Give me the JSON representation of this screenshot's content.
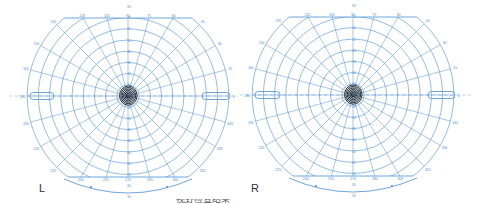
{
  "chart_data": [
    {
      "type": "polar-perimetry",
      "title": "Visual field (left eye)",
      "eye": "L",
      "center": [
        128,
        96
      ],
      "px_per_10deg": 11.2,
      "rings_deg": [
        10,
        20,
        30,
        40,
        50,
        60,
        70,
        80,
        90
      ],
      "meridians_deg": [
        0,
        15,
        30,
        45,
        60,
        75,
        90,
        105,
        120,
        135,
        150,
        165,
        180,
        195,
        210,
        225,
        240,
        255,
        270,
        285,
        300,
        315,
        330,
        345
      ],
      "meridian_labels": [
        "0",
        "15",
        "30",
        "45",
        "60",
        "75",
        "90",
        "105",
        "120",
        "135",
        "150",
        "165",
        "180",
        "195",
        "210",
        "225",
        "240",
        "255",
        "270",
        "285",
        "300",
        "315",
        "330",
        "345"
      ],
      "top_clip_y": 18,
      "bottom_line_y": 177,
      "isopters_deg": [
        1,
        2,
        3,
        4,
        5,
        6
      ],
      "blind_spots": [
        {
          "side": "left",
          "x1": 30,
          "x2": 54
        },
        {
          "side": "right",
          "x1": 202,
          "x2": 230
        }
      ],
      "grid_color": "#4a8fd1",
      "isopter_color": "#1c1c1c"
    },
    {
      "type": "polar-perimetry",
      "title": "Visual field (right eye)",
      "eye": "R",
      "center": [
        115,
        95
      ],
      "px_per_10deg": 11.2,
      "rings_deg": [
        10,
        20,
        30,
        40,
        50,
        60,
        70,
        80,
        90
      ],
      "meridians_deg": [
        0,
        15,
        30,
        45,
        60,
        75,
        90,
        105,
        120,
        135,
        150,
        165,
        180,
        195,
        210,
        225,
        240,
        255,
        270,
        285,
        300,
        315,
        330,
        345
      ],
      "meridian_labels": [
        "0",
        "15",
        "30",
        "45",
        "60",
        "75",
        "90",
        "105",
        "120",
        "135",
        "150",
        "165",
        "180",
        "195",
        "210",
        "225",
        "240",
        "255",
        "270",
        "285",
        "300",
        "315",
        "330",
        "345"
      ],
      "top_clip_y": 17,
      "bottom_line_y": 176,
      "isopters_deg": [
        1,
        2,
        3,
        4,
        5,
        6
      ],
      "blind_spots": [
        {
          "side": "left",
          "x1": 17,
          "x2": 42
        },
        {
          "side": "right",
          "x1": 190,
          "x2": 217
        }
      ],
      "grid_color": "#4a8fd1",
      "isopter_color": "#1c1c1c"
    }
  ],
  "labels": {
    "left_eye": "L",
    "right_eye": "R"
  },
  "footer": {
    "partial_text": "视野检查结果"
  }
}
